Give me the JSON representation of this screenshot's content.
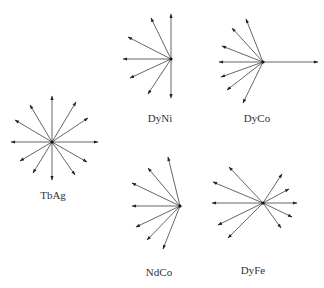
{
  "diagram": {
    "title": "",
    "line_color": "#555555",
    "head_color": "#222222",
    "center_color": "#111111",
    "label_color": "#333333",
    "groups": [
      {
        "name": "TbAg",
        "label": "TbAg",
        "center": [
          52,
          142
        ],
        "label_pos": [
          53,
          195
        ],
        "tips": [
          [
            52,
            96
          ],
          [
            76,
            102
          ],
          [
            88,
            118
          ],
          [
            98,
            142
          ],
          [
            87,
            162
          ],
          [
            75,
            175
          ],
          [
            52,
            180
          ],
          [
            33,
            173
          ],
          [
            20,
            161
          ],
          [
            11,
            142
          ],
          [
            15,
            120
          ],
          [
            30,
            105
          ]
        ]
      },
      {
        "name": "DyNi",
        "label": "DyNi",
        "center": [
          171,
          59
        ],
        "label_pos": [
          160,
          118
        ],
        "tips": [
          [
            171,
            14
          ],
          [
            151,
            18
          ],
          [
            128,
            37
          ],
          [
            123,
            59
          ],
          [
            130,
            78
          ],
          [
            148,
            94
          ],
          [
            171,
            98
          ]
        ]
      },
      {
        "name": "DyCo",
        "label": "DyCo",
        "center": [
          263,
          62
        ],
        "label_pos": [
          257,
          118
        ],
        "tips": [
          [
            318,
            62
          ],
          [
            246,
            19
          ],
          [
            232,
            28
          ],
          [
            222,
            46
          ],
          [
            219,
            62
          ],
          [
            221,
            77
          ],
          [
            227,
            90
          ],
          [
            243,
            103
          ]
        ]
      },
      {
        "name": "NdCo",
        "label": "NdCo",
        "center": [
          180,
          206
        ],
        "label_pos": [
          159,
          272
        ],
        "tips": [
          [
            168,
            157
          ],
          [
            148,
            168
          ],
          [
            132,
            183
          ],
          [
            132,
            206
          ],
          [
            136,
            227
          ],
          [
            147,
            240
          ],
          [
            163,
            249
          ]
        ]
      },
      {
        "name": "DyFe",
        "label": "DyFe",
        "center": [
          263,
          203
        ],
        "label_pos": [
          253,
          270
        ],
        "tips": [
          [
            229,
            167
          ],
          [
            213,
            182
          ],
          [
            212,
            203
          ],
          [
            218,
            225
          ],
          [
            228,
            238
          ],
          [
            282,
            174
          ],
          [
            289,
            189
          ],
          [
            297,
            203
          ],
          [
            292,
            217
          ],
          [
            281,
            228
          ]
        ]
      }
    ]
  }
}
